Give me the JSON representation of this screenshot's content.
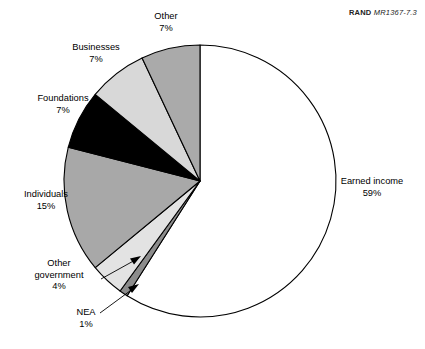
{
  "figure": {
    "source_note": {
      "bold_part": "RAND",
      "italic_part": "MR1367-7.3"
    }
  },
  "chart_data": {
    "type": "pie",
    "title": "",
    "xlabel": "",
    "ylabel": "",
    "legend_position": "none",
    "grid": false,
    "start_angle_deg": 0,
    "direction": "clockwise",
    "categories": [
      "Earned income",
      "NEA",
      "Other government",
      "Individuals",
      "Foundations",
      "Businesses",
      "Other"
    ],
    "values": [
      59,
      1,
      4,
      15,
      7,
      7,
      7
    ],
    "unit": "%",
    "slices": [
      {
        "label": "Earned income",
        "value": 59,
        "pct_text": "59%",
        "fill": "#ffffff",
        "start_deg": 0,
        "end_deg": 212.4
      },
      {
        "label": "NEA",
        "value": 1,
        "pct_text": "1%",
        "fill": "#8c8c8c",
        "start_deg": 212.4,
        "end_deg": 216.0
      },
      {
        "label": "Other government",
        "value": 4,
        "pct_text": "4%",
        "fill": "#e3e3e3",
        "start_deg": 216.0,
        "end_deg": 230.4
      },
      {
        "label": "Individuals",
        "value": 15,
        "pct_text": "15%",
        "fill": "#a8a8a8",
        "start_deg": 230.4,
        "end_deg": 284.4
      },
      {
        "label": "Foundations",
        "value": 7,
        "pct_text": "7%",
        "fill": "#000000",
        "start_deg": 284.4,
        "end_deg": 309.6
      },
      {
        "label": "Businesses",
        "value": 7,
        "pct_text": "7%",
        "fill": "#d8d8d8",
        "start_deg": 309.6,
        "end_deg": 334.8
      },
      {
        "label": "Other",
        "value": 7,
        "pct_text": "7%",
        "fill": "#aaaaaa",
        "start_deg": 334.8,
        "end_deg": 360.0
      }
    ]
  },
  "labels": {
    "other": {
      "name": "Other",
      "pct": "7%"
    },
    "businesses": {
      "name": "Businesses",
      "pct": "7%"
    },
    "foundations": {
      "name": "Foundations",
      "pct": "7%"
    },
    "individuals": {
      "name": "Individuals",
      "pct": "15%"
    },
    "other_government": {
      "name_line1": "Other",
      "name_line2": "government",
      "pct": "4%"
    },
    "nea": {
      "name": "NEA",
      "pct": "1%"
    },
    "earned_income": {
      "name": "Earned income",
      "pct": "59%"
    }
  }
}
